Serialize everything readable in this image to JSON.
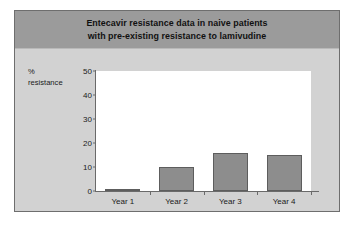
{
  "figure": {
    "title": "Entecavir resistance data in naive patients\nwith pre-existing resistance to lamivudine",
    "y_caption": "%\nresistance",
    "colors": {
      "header_band": "#9b9b9b",
      "body_background": "#d2d2d2",
      "frame_border": "#6e6e6e",
      "plot_background": "#ffffff",
      "bar_fill": "#8d8d8d",
      "bar_border": "#5d5d5d",
      "axis": "#6a6a6a"
    }
  },
  "chart_data": {
    "type": "bar",
    "title": "Entecavir resistance data in naive patients with pre-existing resistance to lamivudine",
    "categories": [
      "Year 1",
      "Year 2",
      "Year 3",
      "Year 4"
    ],
    "values": [
      1,
      10,
      16,
      15
    ],
    "xlabel": "",
    "ylabel": "% resistance",
    "ylim": [
      0,
      50
    ],
    "yticks": [
      0,
      10,
      20,
      30,
      40,
      50
    ],
    "ytick_labels": [
      "0",
      "10",
      "20",
      "30",
      "40",
      "50"
    ],
    "grid": false,
    "legend": false
  }
}
